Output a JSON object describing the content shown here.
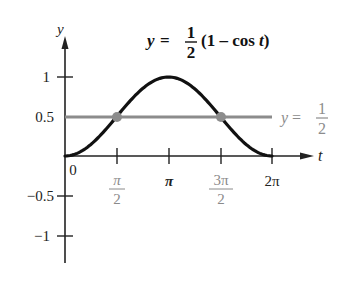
{
  "chart_data": {
    "type": "line",
    "title_parts": {
      "lhs": "y =",
      "num": "1",
      "den": "2",
      "rhs": "(1 – cos t)"
    },
    "xlabel": "t",
    "ylabel": "y",
    "xlim": [
      0,
      6.2832
    ],
    "ylim": [
      -1.2,
      1.3
    ],
    "grid": false,
    "legend": "none",
    "x_ticks": [
      {
        "value": 1.5708,
        "label_num": "π",
        "label_den": "2",
        "gray": true
      },
      {
        "value": 3.1416,
        "label": "π",
        "gray": false
      },
      {
        "value": 4.7124,
        "label_num": "3π",
        "label_den": "2",
        "gray": true
      },
      {
        "value": 6.2832,
        "label": "2π",
        "gray": false
      }
    ],
    "origin_label": "0",
    "y_ticks": [
      {
        "value": 1,
        "label": "1"
      },
      {
        "value": 0.5,
        "label": "0.5"
      },
      {
        "value": -0.5,
        "label": "−0.5"
      },
      {
        "value": -1,
        "label": "−1"
      }
    ],
    "series": [
      {
        "name": "y = 1/2 (1 − cos t)",
        "color": "#111111",
        "x": [
          0,
          0.7854,
          1.5708,
          2.3562,
          3.1416,
          3.927,
          4.7124,
          5.4978,
          6.2832
        ],
        "values": [
          0,
          0.146,
          0.5,
          0.854,
          1,
          0.854,
          0.5,
          0.146,
          0
        ]
      },
      {
        "name": "y = 1/2",
        "color": "#8c8c8c",
        "x": [
          0,
          6.2832
        ],
        "values": [
          0.5,
          0.5
        ],
        "label_parts": {
          "lhs": "y =",
          "num": "1",
          "den": "2"
        }
      }
    ],
    "annotations": [
      {
        "type": "point",
        "x": 1.5708,
        "y": 0.5,
        "color": "#8c8c8c"
      },
      {
        "type": "point",
        "x": 4.7124,
        "y": 0.5,
        "color": "#8c8c8c"
      }
    ]
  }
}
